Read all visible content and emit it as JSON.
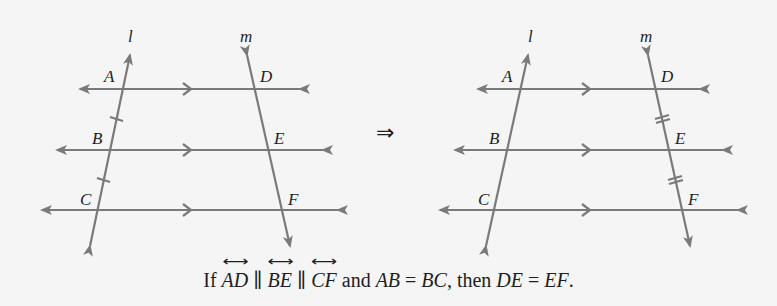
{
  "colors": {
    "line": "#7a7a7a",
    "text": "#1e1e1e",
    "background": "#f5f5f5"
  },
  "left_diagram": {
    "transversal_labels": {
      "l": "l",
      "m": "m"
    },
    "points": {
      "A": "A",
      "B": "B",
      "C": "C",
      "D": "D",
      "E": "E",
      "F": "F"
    },
    "tick_marks": "single ticks on segments AB and BC of line l"
  },
  "implies_symbol": "⇒",
  "right_diagram": {
    "transversal_labels": {
      "l": "l",
      "m": "m"
    },
    "points": {
      "A": "A",
      "B": "B",
      "C": "C",
      "D": "D",
      "E": "E",
      "F": "F"
    },
    "tick_marks": "double ticks on segments DE and EF of line m"
  },
  "caption": {
    "if": "If",
    "line1": "AD",
    "parallel1": "∥",
    "line2": "BE",
    "parallel2": "∥",
    "line3": "CF",
    "and": "and",
    "seg1": "AB",
    "eq1": "=",
    "seg2": "BC",
    "comma_then": ", then",
    "seg3": "DE",
    "eq2": "=",
    "seg4": "EF",
    "period": "."
  }
}
